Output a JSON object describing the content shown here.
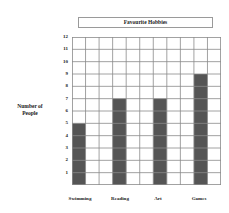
{
  "chart_data": {
    "type": "bar",
    "title": "Favourite Hobbies",
    "xlabel": "",
    "ylabel": "Number of People",
    "categories": [
      "Swimming",
      "Reading",
      "Art",
      "Games"
    ],
    "values": [
      5,
      7,
      7,
      9
    ],
    "ylim": [
      0,
      12
    ],
    "yticks": [
      "1",
      "2",
      "3",
      "4",
      "5",
      "6",
      "7",
      "8",
      "9",
      "10",
      "11",
      "12"
    ],
    "grid": true,
    "legend": null,
    "bar_color": "#555555"
  },
  "labels": {
    "title": "Favourite Hobbies",
    "ylabel_line1": "Number of",
    "ylabel_line2": "People"
  }
}
